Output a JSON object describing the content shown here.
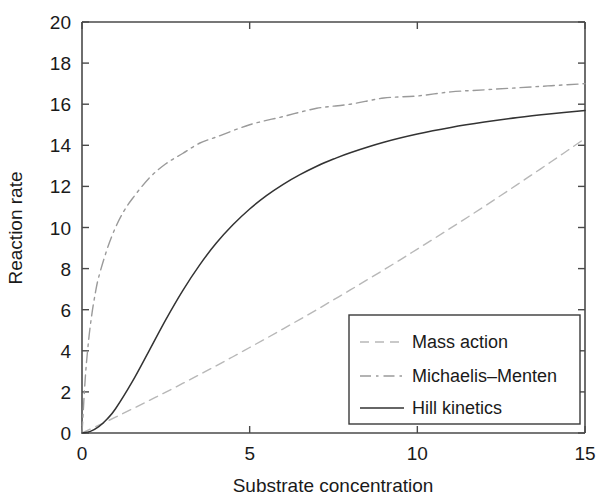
{
  "chart_data": {
    "type": "line",
    "title": "",
    "xlabel": "Substrate concentration",
    "ylabel": "Reaction rate",
    "xlim": [
      0,
      15
    ],
    "ylim": [
      0,
      20
    ],
    "xticks": [
      0,
      5,
      10,
      15
    ],
    "yticks": [
      0,
      2,
      4,
      6,
      8,
      10,
      12,
      14,
      16,
      18,
      20
    ],
    "xtick_labels": [
      "0",
      "5",
      "10",
      "15"
    ],
    "ytick_labels": [
      "0",
      "2",
      "4",
      "6",
      "8",
      "10",
      "12",
      "14",
      "16",
      "18",
      "20"
    ],
    "grid": false,
    "legend_position": "lower right",
    "series": [
      {
        "name": "Mass action",
        "style": "dashed",
        "color": "#b8b8b8",
        "x": [
          0,
          0.5,
          1,
          1.5,
          2,
          2.5,
          3,
          3.5,
          4,
          4.5,
          5,
          5.5,
          6,
          6.5,
          7,
          7.5,
          8,
          8.5,
          9,
          9.5,
          10,
          10.5,
          11,
          11.5,
          12,
          12.5,
          13,
          13.5,
          14,
          14.5,
          15
        ],
        "values": [
          0.0,
          0.38,
          0.77,
          1.17,
          1.58,
          1.99,
          2.41,
          2.84,
          3.27,
          3.71,
          4.16,
          4.61,
          5.07,
          5.53,
          6.0,
          6.48,
          6.96,
          7.45,
          7.94,
          8.44,
          8.95,
          9.46,
          9.98,
          10.5,
          11.03,
          11.57,
          12.11,
          12.66,
          13.21,
          13.77,
          14.33
        ]
      },
      {
        "name": "Michaelis–Menten",
        "style": "dash-dot",
        "color": "#9a9a9a",
        "x": [
          0,
          0.1,
          0.2,
          0.3,
          0.4,
          0.5,
          0.75,
          1,
          1.25,
          1.5,
          2,
          2.5,
          3,
          3.5,
          4,
          5,
          6,
          7,
          8,
          9,
          10,
          11,
          12,
          13,
          14,
          15
        ],
        "values": [
          0.0,
          2.73,
          4.55,
          5.85,
          6.83,
          7.6,
          8.95,
          10.0,
          10.8,
          11.4,
          12.4,
          13.1,
          13.6,
          14.1,
          14.4,
          15.0,
          15.4,
          15.8,
          16.0,
          16.3,
          16.4,
          16.6,
          16.7,
          16.8,
          16.9,
          17.0
        ]
      },
      {
        "name": "Hill kinetics",
        "style": "solid",
        "color": "#333333",
        "x": [
          0,
          0.25,
          0.5,
          0.75,
          1,
          1.5,
          2,
          2.5,
          3,
          3.5,
          4,
          4.5,
          5,
          5.5,
          6,
          6.5,
          7,
          7.5,
          8,
          9,
          10,
          11,
          12,
          13,
          14,
          15
        ],
        "values": [
          0.0,
          0.08,
          0.31,
          0.68,
          1.18,
          2.5,
          4.0,
          5.52,
          6.92,
          8.16,
          9.23,
          10.13,
          10.9,
          11.55,
          12.1,
          12.57,
          12.98,
          13.33,
          13.64,
          14.15,
          14.55,
          14.87,
          15.13,
          15.35,
          15.53,
          15.69
        ]
      }
    ]
  },
  "axes": {
    "x_title": "Substrate concentration",
    "y_title": "Reaction rate"
  },
  "legend": {
    "entries": [
      {
        "label": "Mass action",
        "style": "dashed"
      },
      {
        "label": "Michaelis–Menten",
        "style": "dash-dot"
      },
      {
        "label": "Hill kinetics",
        "style": "solid"
      }
    ]
  },
  "colors": {
    "mass_action": "#b8b8b8",
    "michaelis_menten": "#9a9a9a",
    "hill_kinetics": "#333333",
    "axis": "#4a4a4a",
    "text": "#1a1a1a",
    "background": "#ffffff"
  }
}
